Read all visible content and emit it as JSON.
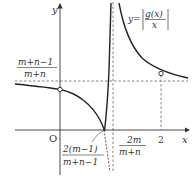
{
  "diagram": {
    "type": "function-graph",
    "axes": {
      "x_label": "x",
      "y_label": "y",
      "origin_label": "O"
    },
    "function_label": {
      "prefix": "y=",
      "numerator": "g(x)",
      "denominator": "x"
    },
    "horizontal_asymptote": {
      "numerator": "m+n−1",
      "denominator": "m+n"
    },
    "vertical_asymptote": {
      "numerator": "2m",
      "denominator": "m+n"
    },
    "root_label": {
      "numerator": "2(m−1)",
      "denominator": "m+n−1"
    },
    "x_tick": "2",
    "open_points": [
      {
        "label": "y-intercept (open)",
        "position": "x=0"
      },
      {
        "label": "point at x=2 (open)",
        "position": "x=2"
      }
    ],
    "colors": {
      "curve": "#222222",
      "axis": "#333333",
      "dashed": "#666666"
    }
  }
}
